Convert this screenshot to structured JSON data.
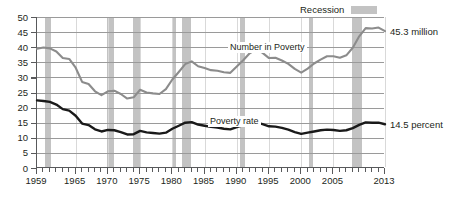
{
  "legend": {
    "recession_label": "Recession",
    "recession_color": "#c3c3c3"
  },
  "annotations": {
    "number_in_poverty": "Number in Poverty",
    "poverty_rate": "Poverty rate",
    "end_number": "45.3 million",
    "end_rate": "14.5 percent"
  },
  "chart_data": {
    "type": "line",
    "title": "",
    "subtitle": "",
    "xlabel": "",
    "ylabel": "",
    "xlim": [
      1959,
      2013
    ],
    "ylim": [
      0,
      50
    ],
    "yticks": [
      0,
      5,
      10,
      15,
      20,
      25,
      30,
      35,
      40,
      45,
      50
    ],
    "xticks_labeled": [
      1959,
      1965,
      1970,
      1975,
      1980,
      1985,
      1990,
      1995,
      2000,
      2005,
      2013
    ],
    "xtick_step_minor": 1,
    "grid": "horizontal",
    "legend_position": "top-right",
    "x": [
      1959,
      1960,
      1961,
      1962,
      1963,
      1964,
      1965,
      1966,
      1967,
      1968,
      1969,
      1970,
      1971,
      1972,
      1973,
      1974,
      1975,
      1976,
      1977,
      1978,
      1979,
      1980,
      1981,
      1982,
      1983,
      1984,
      1985,
      1986,
      1987,
      1988,
      1989,
      1990,
      1991,
      1992,
      1993,
      1994,
      1995,
      1996,
      1997,
      1998,
      1999,
      2000,
      2001,
      2002,
      2003,
      2004,
      2005,
      2006,
      2007,
      2008,
      2009,
      2010,
      2011,
      2012,
      2013
    ],
    "series": [
      {
        "name": "Number in Poverty",
        "units": "millions",
        "color": "#8c8c8c",
        "label": "Number in Poverty",
        "end_value_label": "45.3 million",
        "values": [
          39.5,
          39.9,
          39.6,
          38.6,
          36.4,
          36.1,
          33.2,
          28.5,
          27.8,
          25.4,
          24.1,
          25.4,
          25.6,
          24.5,
          23.0,
          23.4,
          25.9,
          25.0,
          24.7,
          24.5,
          26.1,
          29.3,
          31.8,
          34.4,
          35.3,
          33.7,
          33.1,
          32.4,
          32.2,
          31.7,
          31.5,
          33.6,
          35.7,
          38.0,
          39.3,
          38.1,
          36.4,
          36.5,
          35.6,
          34.5,
          32.8,
          31.6,
          32.9,
          34.6,
          35.9,
          37.0,
          37.0,
          36.5,
          37.3,
          39.8,
          43.6,
          46.3,
          46.2,
          46.5,
          45.3
        ]
      },
      {
        "name": "Poverty rate",
        "units": "percent",
        "color": "#1a1a1a",
        "label": "Poverty rate",
        "end_value_label": "14.5 percent",
        "values": [
          22.4,
          22.2,
          21.9,
          21.0,
          19.5,
          19.0,
          17.3,
          14.7,
          14.2,
          12.8,
          12.1,
          12.6,
          12.5,
          11.9,
          11.1,
          11.2,
          12.3,
          11.8,
          11.6,
          11.4,
          11.7,
          13.0,
          14.0,
          15.0,
          15.2,
          14.4,
          14.0,
          13.6,
          13.4,
          13.0,
          12.8,
          13.5,
          14.2,
          14.8,
          15.1,
          14.5,
          13.8,
          13.7,
          13.3,
          12.7,
          11.9,
          11.3,
          11.7,
          12.1,
          12.5,
          12.7,
          12.6,
          12.3,
          12.5,
          13.2,
          14.3,
          15.1,
          15.0,
          15.0,
          14.5
        ]
      }
    ],
    "recession_bands": [
      {
        "start": 1960.3,
        "end": 1961.1
      },
      {
        "start": 1969.9,
        "end": 1970.9
      },
      {
        "start": 1973.9,
        "end": 1975.2
      },
      {
        "start": 1980.0,
        "end": 1980.5
      },
      {
        "start": 1981.5,
        "end": 1982.9
      },
      {
        "start": 1990.5,
        "end": 1991.2
      },
      {
        "start": 2001.2,
        "end": 2001.9
      },
      {
        "start": 2007.9,
        "end": 2009.5
      }
    ]
  }
}
